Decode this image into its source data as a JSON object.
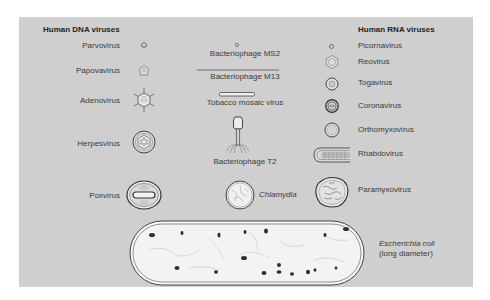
{
  "figure": {
    "colors": {
      "panel_background": "#cfcfcf",
      "page_background": "#ffffff",
      "ink": "#3a3a3a",
      "cell_fill": "#f2f2f2"
    },
    "dna_column": {
      "heading": "Human DNA viruses",
      "items": [
        {
          "label": "Parvovirus",
          "icon": "tiny-icosahedron-icon"
        },
        {
          "label": "Papovavirus",
          "icon": "small-icosahedron-icon"
        },
        {
          "label": "Adenovirus",
          "icon": "spiked-icosahedron-icon"
        },
        {
          "label": "Herpesvirus",
          "icon": "enveloped-icosahedron-icon"
        },
        {
          "label": "Poxvirus",
          "icon": "brick-shaped-virion-icon"
        }
      ]
    },
    "center_column": {
      "items": [
        {
          "label": "Bacteriophage MS2",
          "icon": "tiny-sphere-icon"
        },
        {
          "label": "Bacteriophage M13",
          "icon": "long-filament-icon"
        },
        {
          "label": "Tobacco mosaic virus",
          "icon": "rod-icon"
        },
        {
          "label": "Bacteriophage T2",
          "icon": "tailed-phage-icon"
        },
        {
          "label": "Chlamydia",
          "icon": "round-cell-icon"
        }
      ]
    },
    "rna_column": {
      "heading": "Human RNA viruses",
      "items": [
        {
          "label": "Picornavirus",
          "icon": "tiny-sphere-icon"
        },
        {
          "label": "Reovirus",
          "icon": "double-capsid-icon"
        },
        {
          "label": "Togavirus",
          "icon": "enveloped-sphere-icon"
        },
        {
          "label": "Coronavirus",
          "icon": "crowned-sphere-icon"
        },
        {
          "label": "Orthomyxovirus",
          "icon": "enveloped-sphere-icon"
        },
        {
          "label": "Rhabdovirus",
          "icon": "bullet-shaped-virion-icon"
        },
        {
          "label": "Paramyxovirus",
          "icon": "pleomorphic-envelope-icon"
        }
      ]
    },
    "bacterium": {
      "label_line1": "Escherichia coli",
      "label_line2": "(long diameter)",
      "icon": "rod-bacterium-icon"
    }
  }
}
